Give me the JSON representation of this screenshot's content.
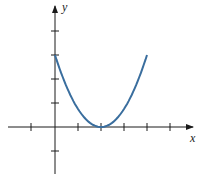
{
  "chart_data": {
    "type": "line",
    "title": "",
    "xlabel": "x",
    "ylabel": "y",
    "xlim": [
      -2,
      5
    ],
    "ylim": [
      -1,
      5
    ],
    "grid": false,
    "legend": null,
    "x_ticks": [
      -2,
      -1,
      1,
      2,
      3,
      4,
      5
    ],
    "y_ticks": [
      -1,
      1,
      2,
      3,
      4
    ],
    "tick_labels_shown": false,
    "series": [
      {
        "name": "parabola",
        "color": "#3a6e9e",
        "x": [
          0,
          0.5,
          1,
          1.5,
          2,
          2.5,
          3,
          3.5,
          4
        ],
        "values": [
          3,
          1.6875,
          0.75,
          0.1875,
          0,
          0.1875,
          0.75,
          1.6875,
          3
        ]
      }
    ],
    "annotations": []
  },
  "axes": {
    "x_label": "x",
    "y_label": "y"
  }
}
